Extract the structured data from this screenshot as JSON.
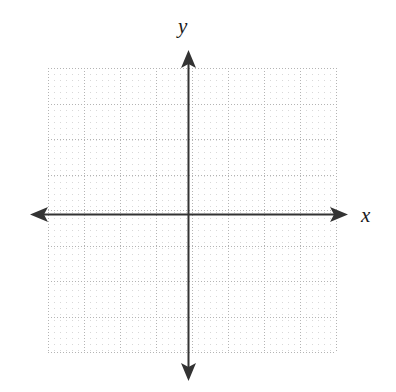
{
  "figure": {
    "title": "",
    "type": "blank-cartesian-grid",
    "background_color": "#ffffff"
  },
  "axes": {
    "x_label": "x",
    "y_label": "y",
    "axis_color": "#333333",
    "arrowheads": [
      "left",
      "right",
      "up",
      "down"
    ],
    "origin": {
      "x": 188,
      "y": 214
    }
  },
  "grid": {
    "major_color": "#b4b4b4",
    "minor_color": "#d8d8d8",
    "major_spacing_px": 36,
    "minor_spacing_px": 6,
    "columns": 8,
    "rows": 8,
    "left": 48,
    "top": 68,
    "width": 288,
    "height": 284,
    "style": "dotted"
  },
  "chart_data": {
    "type": "scatter",
    "title": "",
    "xlabel": "x",
    "ylabel": "y",
    "series": [],
    "x": [],
    "values": [],
    "xlim": [
      -4,
      4
    ],
    "ylim": [
      -4,
      4
    ],
    "xticks": [],
    "yticks": [],
    "grid": true,
    "legend": "none",
    "annotations": []
  }
}
